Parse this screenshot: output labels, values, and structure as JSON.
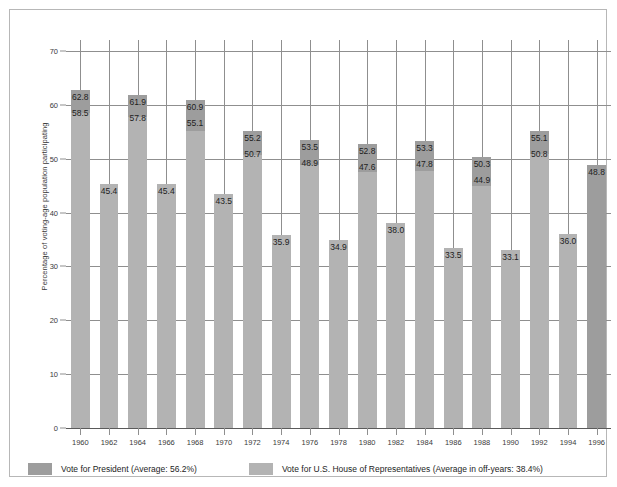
{
  "chart_data": {
    "type": "bar",
    "title": "",
    "xlabel": "",
    "ylabel": "Percentage of voting-age population participating",
    "ylim": [
      0,
      70
    ],
    "ytick_values": [
      0,
      10,
      20,
      30,
      40,
      50,
      60,
      70
    ],
    "ytick_labels": [
      "0",
      "10",
      "20",
      "30",
      "40",
      "50",
      "60",
      "70"
    ],
    "grid": true,
    "legend_position": "bottom",
    "categories": [
      "1960",
      "1962",
      "1964",
      "1966",
      "1968",
      "1970",
      "1972",
      "1974",
      "1976",
      "1978",
      "1980",
      "1982",
      "1984",
      "1986",
      "1988",
      "1990",
      "1992",
      "1994",
      "1996"
    ],
    "series": [
      {
        "name": "Vote for President (Average: 56.2%)",
        "color": "#9d9d9d",
        "values": [
          62.8,
          null,
          61.9,
          null,
          60.9,
          null,
          55.2,
          null,
          53.5,
          null,
          52.8,
          null,
          53.3,
          null,
          50.3,
          null,
          55.1,
          null,
          48.8
        ]
      },
      {
        "name": "Vote for U.S. House of Representatives (Average in off-years: 38.4%)",
        "color": "#b3b3b3",
        "values": [
          58.5,
          45.4,
          57.8,
          45.4,
          55.1,
          43.5,
          50.7,
          35.9,
          48.9,
          34.9,
          47.6,
          38.0,
          47.8,
          33.5,
          44.9,
          33.1,
          50.8,
          36.0,
          null
        ]
      }
    ],
    "bars": [
      {
        "year": "1960",
        "top": 62.8,
        "pres_label": "62.8",
        "house_label": "58.5",
        "house_value": 58.5,
        "presidential_year": true
      },
      {
        "year": "1962",
        "top": 45.4,
        "pres_label": null,
        "house_label": "45.4",
        "house_value": 45.4,
        "presidential_year": false
      },
      {
        "year": "1964",
        "top": 61.9,
        "pres_label": "61.9",
        "house_label": "57.8",
        "house_value": 57.8,
        "presidential_year": true
      },
      {
        "year": "1966",
        "top": 45.4,
        "pres_label": null,
        "house_label": "45.4",
        "house_value": 45.4,
        "presidential_year": false
      },
      {
        "year": "1968",
        "top": 60.9,
        "pres_label": "60.9",
        "house_label": "55.1",
        "house_value": 55.1,
        "presidential_year": true
      },
      {
        "year": "1970",
        "top": 43.5,
        "pres_label": null,
        "house_label": "43.5",
        "house_value": 43.5,
        "presidential_year": false
      },
      {
        "year": "1972",
        "top": 55.2,
        "pres_label": "55.2",
        "house_label": "50.7",
        "house_value": 50.7,
        "presidential_year": true
      },
      {
        "year": "1974",
        "top": 35.9,
        "pres_label": null,
        "house_label": "35.9",
        "house_value": 35.9,
        "presidential_year": false
      },
      {
        "year": "1976",
        "top": 53.5,
        "pres_label": "53.5",
        "house_label": "48.9",
        "house_value": 48.9,
        "presidential_year": true
      },
      {
        "year": "1978",
        "top": 34.9,
        "pres_label": null,
        "house_label": "34.9",
        "house_value": 34.9,
        "presidential_year": false
      },
      {
        "year": "1980",
        "top": 52.8,
        "pres_label": "52.8",
        "house_label": "47.6",
        "house_value": 47.6,
        "presidential_year": true
      },
      {
        "year": "1982",
        "top": 38.0,
        "pres_label": null,
        "house_label": "38.0",
        "house_value": 38.0,
        "presidential_year": false
      },
      {
        "year": "1984",
        "top": 53.3,
        "pres_label": "53.3",
        "house_label": "47.8",
        "house_value": 47.8,
        "presidential_year": true
      },
      {
        "year": "1986",
        "top": 33.5,
        "pres_label": null,
        "house_label": "33.5",
        "house_value": 33.5,
        "presidential_year": false
      },
      {
        "year": "1988",
        "top": 50.3,
        "pres_label": "50.3",
        "house_label": "44.9",
        "house_value": 44.9,
        "presidential_year": true
      },
      {
        "year": "1990",
        "top": 33.1,
        "pres_label": null,
        "house_label": "33.1",
        "house_value": 33.1,
        "presidential_year": false
      },
      {
        "year": "1992",
        "top": 55.1,
        "pres_label": "55.1",
        "house_label": "50.8",
        "house_value": 50.8,
        "presidential_year": true
      },
      {
        "year": "1994",
        "top": 36.0,
        "pres_label": null,
        "house_label": "36.0",
        "house_value": 36.0,
        "presidential_year": false
      },
      {
        "year": "1996",
        "top": 48.8,
        "pres_label": "48.8",
        "house_label": null,
        "house_value": null,
        "presidential_year": true
      }
    ]
  },
  "legend": {
    "items": [
      {
        "swatch": "pres",
        "label": "Vote for President (Average: 56.2%)"
      },
      {
        "swatch": "house",
        "label": "Vote for U.S. House of Representatives (Average in off-years: 38.4%)"
      }
    ]
  },
  "axis": {
    "y_title": "Percentage of voting-age population participating"
  },
  "colors": {
    "president_bar": "#9d9d9d",
    "house_bar": "#a8a8a8",
    "gridline": "#8f8f8f",
    "frame": "#b7b7b7",
    "text": "#1d1d1d"
  }
}
